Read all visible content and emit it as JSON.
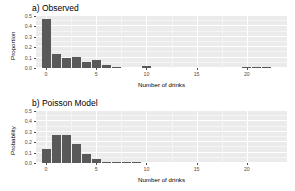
{
  "figure": {
    "background_color": "#ffffff",
    "panel_background_color": "#ebebeb",
    "bar_color": "#595959",
    "grid_color": "#ffffff"
  },
  "chart_data": [
    {
      "type": "bar",
      "title": "a) Observed",
      "xlabel": "Number of drinks",
      "ylabel": "Proportion",
      "xlim": [
        -1,
        24
      ],
      "ylim": [
        0,
        0.5
      ],
      "grid": true,
      "legend": "none",
      "xticks": [
        "0",
        "5",
        "10",
        "15",
        "20"
      ],
      "xtick_values": [
        0,
        5,
        10,
        15,
        20
      ],
      "yticks": [
        "0.0",
        "0.1",
        "0.2",
        "0.3",
        "0.4",
        "0.5"
      ],
      "ytick_values": [
        0.0,
        0.1,
        0.2,
        0.3,
        0.4,
        0.5
      ],
      "categories": [
        0,
        1,
        2,
        3,
        4,
        5,
        6,
        7,
        8,
        9,
        10,
        11,
        12,
        13,
        14,
        15,
        16,
        17,
        18,
        19,
        20,
        21,
        22
      ],
      "values": [
        0.47,
        0.13,
        0.095,
        0.105,
        0.055,
        0.075,
        0.025,
        0.012,
        0.0,
        0.0,
        0.022,
        0.0,
        0.0,
        0.0,
        0.0,
        0.0,
        0.0,
        0.0,
        0.0,
        0.0,
        0.005,
        0.012,
        0.012
      ]
    },
    {
      "type": "bar",
      "title": "b) Poisson Model",
      "xlabel": "Number of drinks",
      "ylabel": "Probability",
      "xlim": [
        -1,
        24
      ],
      "ylim": [
        0,
        0.5
      ],
      "grid": true,
      "legend": "none",
      "xticks": [
        "0",
        "5",
        "10",
        "15",
        "20"
      ],
      "xtick_values": [
        0,
        5,
        10,
        15,
        20
      ],
      "yticks": [
        "0.0",
        "0.1",
        "0.2",
        "0.3",
        "0.4",
        "0.5"
      ],
      "ytick_values": [
        0.0,
        0.1,
        0.2,
        0.3,
        0.4,
        0.5
      ],
      "categories": [
        0,
        1,
        2,
        3,
        4,
        5,
        6,
        7,
        8,
        9,
        10,
        11,
        12,
        13,
        14,
        15,
        16,
        17,
        18,
        19,
        20,
        21,
        22
      ],
      "values": [
        0.135,
        0.27,
        0.27,
        0.18,
        0.09,
        0.036,
        0.012,
        0.0035,
        0.001,
        0.0002,
        0.0,
        0.0,
        0.0,
        0.0,
        0.0,
        0.0,
        0.0,
        0.0,
        0.0,
        0.0,
        0.0,
        0.0,
        0.0
      ]
    }
  ]
}
